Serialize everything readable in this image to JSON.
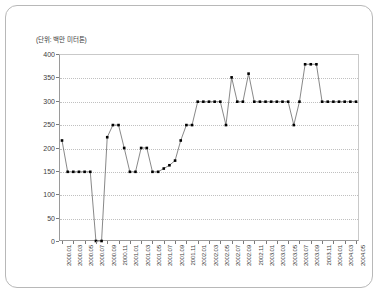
{
  "chart_data": {
    "type": "line",
    "title": "",
    "subtitle": "",
    "unit_label": "(단위: 백만 미터톤)",
    "xlabel": "",
    "ylabel": "",
    "ylim": [
      0,
      400
    ],
    "yticks": [
      0,
      50,
      100,
      150,
      200,
      250,
      300,
      350,
      400
    ],
    "grid": true,
    "legend": false,
    "marker": "square",
    "marker_color": "#000000",
    "line_color": "#555555",
    "categories": [
      "2000.01",
      "2000.02",
      "2000.03",
      "2000.04",
      "2000.05",
      "2000.06",
      "2000.07",
      "2000.08",
      "2000.09",
      "2000.10",
      "2000.11",
      "2000.12",
      "2001.01",
      "2001.02",
      "2001.03",
      "2001.04",
      "2001.05",
      "2001.06",
      "2001.07",
      "2001.08",
      "2001.09",
      "2001.10",
      "2001.11",
      "2001.12",
      "2002.01",
      "2002.02",
      "2002.03",
      "2002.04",
      "2002.05",
      "2002.06",
      "2002.07",
      "2002.08",
      "2002.09",
      "2002.10",
      "2002.11",
      "2002.12",
      "2003.01",
      "2003.02",
      "2003.03",
      "2003.04",
      "2003.05",
      "2003.06",
      "2003.07",
      "2003.08",
      "2003.09",
      "2003.10",
      "2003.11",
      "2003.12",
      "2004.01",
      "2004.02",
      "2004.03",
      "2004.04",
      "2004.05"
    ],
    "tick_labels": [
      "2000.01",
      "2000.03",
      "2000.05",
      "2000.07",
      "2000.09",
      "2000.11",
      "2001.01",
      "2001.03",
      "2001.05",
      "2001.07",
      "2001.09",
      "2001.11",
      "2002.01",
      "2002.03",
      "2002.05",
      "2002.07",
      "2002.09",
      "2002.11",
      "2003.01",
      "2003.03",
      "2003.05",
      "2003.07",
      "2003.09",
      "2003.11",
      "2004.01",
      "2004.03",
      "2004.05"
    ],
    "values": [
      215,
      148,
      148,
      148,
      148,
      148,
      0,
      0,
      222,
      248,
      248,
      199,
      148,
      148,
      199,
      199,
      148,
      148,
      155,
      162,
      172,
      215,
      248,
      248,
      298,
      298,
      298,
      298,
      298,
      248,
      350,
      298,
      298,
      358,
      298,
      298,
      298,
      298,
      298,
      298,
      298,
      248,
      298,
      378,
      378,
      378,
      298,
      298,
      298,
      298,
      298,
      298,
      298
    ]
  },
  "card": {
    "border_color": "#b8b8b8",
    "background": "#ffffff"
  }
}
